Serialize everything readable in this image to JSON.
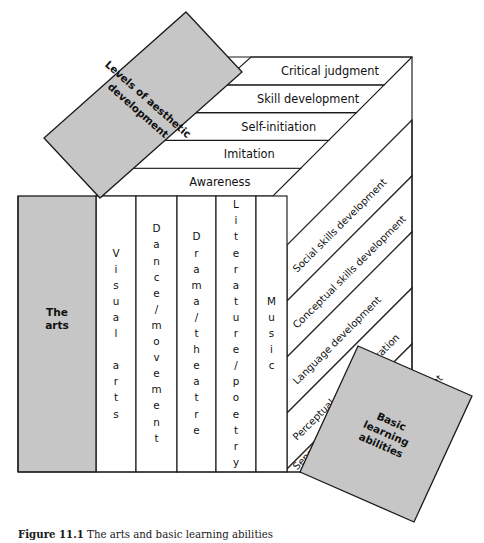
{
  "figure": {
    "caption_label": "Figure 11.1",
    "caption_text": "The arts and basic learning abilities"
  },
  "banners": {
    "top_left": {
      "name": "levels-of-aesthetic-development",
      "line1": "Levels of aesthetic",
      "line2": "development",
      "fill": "#c6c6c6"
    },
    "bottom_right": {
      "name": "basic-learning-abilities",
      "line1": "Basic",
      "line2": "learning",
      "line3": "abilities",
      "fill": "#c6c6c6"
    }
  },
  "arts_block": {
    "line1": "The",
    "line2": "arts",
    "fill": "#c6c6c6"
  },
  "aesthetic_levels": [
    {
      "label": "Critical judgment",
      "order": 5
    },
    {
      "label": "Skill development",
      "order": 4
    },
    {
      "label": "Self-initiation",
      "order": 3
    },
    {
      "label": "Imitation",
      "order": 2
    },
    {
      "label": "Awareness",
      "order": 1
    }
  ],
  "art_forms": [
    {
      "label": "Visual arts",
      "stack": [
        "V",
        "i",
        "s",
        "u",
        "a",
        "l",
        "",
        "a",
        "r",
        "t",
        "s"
      ]
    },
    {
      "label": "Dance/movement",
      "stack": [
        "D",
        "a",
        "n",
        "c",
        "e",
        "/",
        "m",
        "o",
        "v",
        "e",
        "m",
        "e",
        "n",
        "t"
      ]
    },
    {
      "label": "Drama/theatre",
      "stack": [
        "D",
        "r",
        "a",
        "m",
        "a",
        "/",
        "t",
        "h",
        "e",
        "a",
        "t",
        "r",
        "e"
      ]
    },
    {
      "label": "Literature/poetry",
      "stack": [
        "L",
        "i",
        "t",
        "e",
        "r",
        "a",
        "t",
        "u",
        "r",
        "e",
        "/",
        "p",
        "o",
        "e",
        "t",
        "r",
        "y"
      ]
    },
    {
      "label": "Music",
      "stack": [
        "M",
        "u",
        "s",
        "i",
        "c"
      ]
    }
  ],
  "basic_learning_abilities": [
    {
      "label": "Social skills development",
      "order": 6
    },
    {
      "label": "Conceptual skills development",
      "order": 5
    },
    {
      "label": "Language development",
      "order": 4
    },
    {
      "label": "Perceptual motor integration",
      "order": 3
    },
    {
      "label": "Sensory motor integration",
      "order": 2
    },
    {
      "label": "Gross motor development",
      "order": 1
    }
  ],
  "colors": {
    "shaded": "#c6c6c6",
    "stroke": "#1a1a1a",
    "background": "#ffffff"
  }
}
